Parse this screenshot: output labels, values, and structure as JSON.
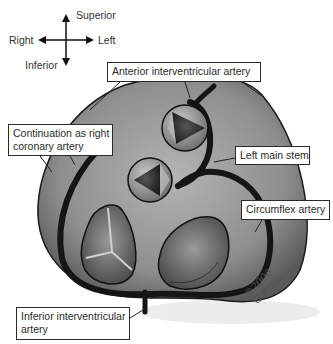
{
  "figure": {
    "type": "anatomical-diagram"
  },
  "orientation": {
    "superior": "Superior",
    "inferior": "Inferior",
    "right": "Right",
    "left": "Left"
  },
  "labels": {
    "anterior_iv": "Anterior interventricular artery",
    "continuation_line1": "Continuation as right",
    "continuation_line2": "coronary artery",
    "left_main": "Left main stem",
    "circumflex": "Circumflex artery",
    "inferior_iv_line1": "Inferior interventricular",
    "inferior_iv_line2": "artery"
  },
  "signature": {
    "line1": "©2000",
    "line2": "G.Price"
  },
  "colors": {
    "heart_fill": "#8a8a8a",
    "heart_outline": "#1a1a1a",
    "artery": "#151515",
    "valve_fill": "#6e6e6e",
    "background": "#ffffff"
  }
}
